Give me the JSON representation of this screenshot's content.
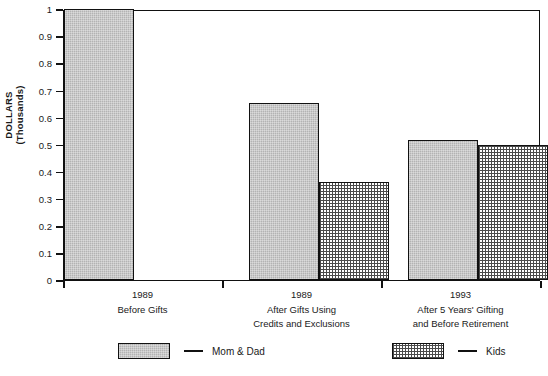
{
  "chart_data": {
    "type": "bar",
    "title": "",
    "xlabel": "",
    "ylabel": "DOLLARS (Thousands)",
    "ylabel_lines": [
      "DOLLARS",
      "(Thousands)"
    ],
    "ylim": [
      0,
      1
    ],
    "yticks": [
      "0",
      "0.1",
      "0.2",
      "0.3",
      "0.4",
      "0.5",
      "0.6",
      "0.7",
      "0.8",
      "0.9",
      "1"
    ],
    "grid": false,
    "legend_position": "bottom",
    "categories": [
      {
        "year": "1989",
        "desc_lines": [
          "Before Gifts"
        ]
      },
      {
        "year": "1989",
        "desc_lines": [
          "After Gifts Using",
          "Credits and  Exclusions"
        ]
      },
      {
        "year": "1993",
        "desc_lines": [
          "After 5 Years' Gifting",
          "and Before Retirement"
        ]
      }
    ],
    "series": [
      {
        "name": "Mom & Dad",
        "pattern": "solid-gray",
        "color": "#b3b3b3",
        "values": [
          1.0,
          0.655,
          0.515
        ]
      },
      {
        "name": "Kids",
        "pattern": "dotted-grid",
        "color": "#ffffff",
        "values": [
          null,
          0.36,
          0.5
        ]
      }
    ]
  },
  "legend": {
    "entries": [
      {
        "label": "Mom & Dad",
        "dash": "—"
      },
      {
        "label": "Kids",
        "dash": "—"
      }
    ]
  }
}
